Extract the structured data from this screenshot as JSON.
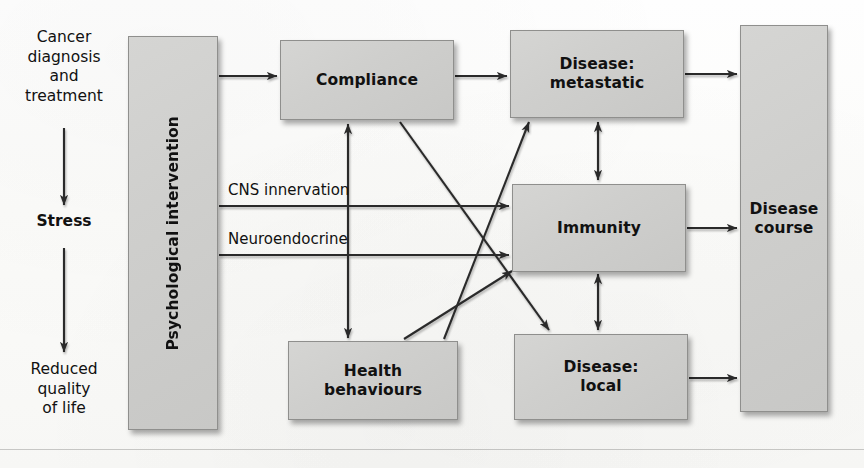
{
  "figure": {
    "background_color": "#fdfdfc",
    "node_fill": "#cfcfcd",
    "node_border": "#8f8f8d",
    "arrow_color": "#2b2b2b",
    "text_color": "#111111"
  },
  "flow_chain": {
    "step1": "Cancer\ndiagnosis\nand\ntreatment",
    "step2": "Stress",
    "step3": "Reduced\nquality\nof life"
  },
  "nodes": {
    "intervention": "Psychological intervention",
    "compliance": "Compliance",
    "health_behaviours": "Health\nbehaviours",
    "disease_metastatic": "Disease:\nmetastatic",
    "immunity": "Immunity",
    "disease_local": "Disease:\nlocal",
    "disease_course": "Disease\ncourse"
  },
  "edge_labels": {
    "cns": "CNS innervation",
    "neuroendocrine": "Neuroendocrine"
  }
}
